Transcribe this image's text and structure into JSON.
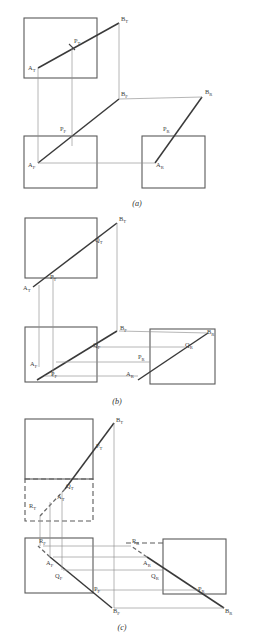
{
  "figure": {
    "background_color": "#ffffff",
    "line_color": "#3a3a3a",
    "box_color": "#5a5a5a",
    "thin_color": "#8e8e8e",
    "label_color": "#3d3d3d"
  },
  "panels": [
    {
      "id": "a",
      "caption": "(a)",
      "boxes": [
        {
          "name": "top-view-plane",
          "x": 24,
          "y": 18,
          "w": 73,
          "h": 60
        },
        {
          "name": "front-view-plane",
          "x": 24,
          "y": 136,
          "w": 73,
          "h": 52
        },
        {
          "name": "right-view-plane",
          "x": 142,
          "y": 136,
          "w": 63,
          "h": 52
        }
      ],
      "labels": [
        {
          "name": "label-b-top",
          "base": "B",
          "sub": "T",
          "x": 121,
          "y": 21
        },
        {
          "name": "label-p-top",
          "base": "P",
          "sub": "T",
          "x": 74,
          "y": 43
        },
        {
          "name": "label-a-top",
          "base": "A",
          "sub": "T",
          "x": 30,
          "y": 70
        },
        {
          "name": "label-b-front",
          "base": "B",
          "sub": "F",
          "x": 121,
          "y": 96
        },
        {
          "name": "label-b-right",
          "base": "B",
          "sub": "R",
          "x": 205,
          "y": 94
        },
        {
          "name": "label-p-front",
          "base": "P",
          "sub": "F",
          "x": 62,
          "y": 130
        },
        {
          "name": "label-p-right",
          "base": "P",
          "sub": "R",
          "x": 164,
          "y": 130
        },
        {
          "name": "label-a-front",
          "base": "A",
          "sub": "F",
          "x": 30,
          "y": 166
        },
        {
          "name": "label-a-right",
          "base": "A",
          "sub": "R",
          "x": 157,
          "y": 166
        }
      ]
    },
    {
      "id": "b",
      "caption": "(b)",
      "boxes": [
        {
          "name": "top-view-plane",
          "x": 25,
          "y": 11,
          "w": 72,
          "h": 60
        },
        {
          "name": "front-view-plane",
          "x": 25,
          "y": 120,
          "w": 72,
          "h": 55
        },
        {
          "name": "right-view-plane",
          "x": 150,
          "y": 122,
          "w": 65,
          "h": 55
        }
      ],
      "labels": [
        {
          "name": "label-b-top",
          "base": "B",
          "sub": "T",
          "x": 118,
          "y": 13
        },
        {
          "name": "label-q-top",
          "base": "Q",
          "sub": "T",
          "x": 95,
          "y": 33
        },
        {
          "name": "label-p-top",
          "base": "P",
          "sub": "T",
          "x": 50,
          "y": 70
        },
        {
          "name": "label-a-top",
          "base": "A",
          "sub": "T",
          "x": 25,
          "y": 82
        },
        {
          "name": "label-b-front",
          "base": "B",
          "sub": "F",
          "x": 119,
          "y": 122
        },
        {
          "name": "label-b-right",
          "base": "B",
          "sub": "R",
          "x": 205,
          "y": 126
        },
        {
          "name": "label-q-front",
          "base": "Q",
          "sub": "F",
          "x": 94,
          "y": 138
        },
        {
          "name": "label-q-right",
          "base": "Q",
          "sub": "R",
          "x": 186,
          "y": 138
        },
        {
          "name": "label-p-right",
          "base": "P",
          "sub": "R",
          "x": 139,
          "y": 152
        },
        {
          "name": "label-a-front",
          "base": "A",
          "sub": "F",
          "x": 31,
          "y": 157
        },
        {
          "name": "label-p-front",
          "base": "P",
          "sub": "F",
          "x": 52,
          "y": 167
        },
        {
          "name": "label-a-right",
          "base": "A",
          "sub": "R",
          "x": 127,
          "y": 167
        }
      ]
    },
    {
      "id": "c",
      "caption": "(c)",
      "boxes": [
        {
          "name": "top-view-plane",
          "x": 25,
          "y": 9,
          "w": 68,
          "h": 60
        },
        {
          "name": "front-view-plane",
          "x": 25,
          "y": 128,
          "w": 68,
          "h": 55
        },
        {
          "name": "right-view-plane",
          "x": 163,
          "y": 129,
          "w": 63,
          "h": 55
        }
      ],
      "dashed_boxes": [
        {
          "name": "extended-top-plane",
          "x": 25,
          "y": 69,
          "w": 68,
          "h": 42
        }
      ],
      "labels": [
        {
          "name": "label-b-top",
          "base": "B",
          "sub": "T",
          "x": 115,
          "y": 11
        },
        {
          "name": "label-p-top",
          "base": "P",
          "sub": "T",
          "x": 96,
          "y": 36
        },
        {
          "name": "label-q-top",
          "base": "Q",
          "sub": "T",
          "x": 68,
          "y": 76
        },
        {
          "name": "label-a-top",
          "base": "A",
          "sub": "T",
          "x": 59,
          "y": 87
        },
        {
          "name": "label-r-top",
          "base": "R",
          "sub": "T",
          "x": 31,
          "y": 94
        },
        {
          "name": "label-r-front",
          "base": "R",
          "sub": "F",
          "x": 40,
          "y": 132
        },
        {
          "name": "label-r-right",
          "base": "R",
          "sub": "R",
          "x": 133,
          "y": 132
        },
        {
          "name": "label-a-front",
          "base": "A",
          "sub": "F",
          "x": 48,
          "y": 153
        },
        {
          "name": "label-a-right",
          "base": "A",
          "sub": "R",
          "x": 144,
          "y": 153
        },
        {
          "name": "label-q-front",
          "base": "Q",
          "sub": "F",
          "x": 57,
          "y": 166
        },
        {
          "name": "label-q-right",
          "base": "Q",
          "sub": "R",
          "x": 152,
          "y": 166
        },
        {
          "name": "label-p-front",
          "base": "P",
          "sub": "F",
          "x": 95,
          "y": 179
        },
        {
          "name": "label-p-right",
          "base": "P",
          "sub": "R",
          "x": 199,
          "y": 179
        },
        {
          "name": "label-b-front",
          "base": "B",
          "sub": "F",
          "x": 114,
          "y": 200
        },
        {
          "name": "label-b-right",
          "base": "B",
          "sub": "R",
          "x": 225,
          "y": 200
        }
      ]
    }
  ],
  "captions": {
    "a": "(a)",
    "b": "(b)",
    "c": "(c)"
  }
}
